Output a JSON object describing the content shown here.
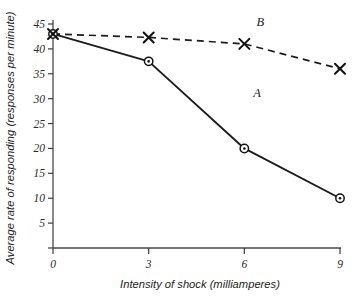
{
  "chart_data": {
    "type": "line",
    "title": "",
    "xlabel": "Intensity of shock (milliamperes)",
    "ylabel": "Average rate of responding (responses per minute)",
    "x": [
      0,
      3,
      6,
      9
    ],
    "xticklabels": [
      "0",
      "3",
      "6",
      "9"
    ],
    "xlim": [
      0,
      9
    ],
    "yticks": [
      0,
      5,
      10,
      15,
      20,
      25,
      30,
      35,
      40,
      45
    ],
    "yticklabels": [
      "",
      "5",
      "10",
      "15",
      "20",
      "25",
      "30",
      "35",
      "40",
      "45"
    ],
    "ylim": [
      0,
      45
    ],
    "grid": false,
    "legend": "inline-curve-labels",
    "series": [
      {
        "name": "A",
        "label": "A",
        "linestyle": "solid",
        "marker": "circle-dot",
        "color": "#111111",
        "values": [
          43,
          37.5,
          20,
          10
        ],
        "label_x": 6.4,
        "label_y": 30.4
      },
      {
        "name": "B",
        "label": "B",
        "linestyle": "dashed",
        "marker": "x",
        "color": "#111111",
        "values": [
          43,
          42.3,
          41,
          36
        ],
        "label_x": 6.5,
        "label_y": 44.6
      }
    ]
  },
  "colors": {
    "background": "#ffffff",
    "ink": "#111111",
    "axis": "#4a4a47"
  }
}
